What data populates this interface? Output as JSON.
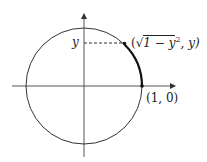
{
  "diagram": {
    "type": "unit-circle",
    "labels": {
      "y_tick": "y",
      "point_open": "(",
      "sqrt_body": "1 − y",
      "sup": "2",
      "point_tail": ", y)",
      "point_10": "(1, 0)"
    },
    "colors": {
      "stroke": "#333333",
      "background": "#ffffff"
    }
  }
}
